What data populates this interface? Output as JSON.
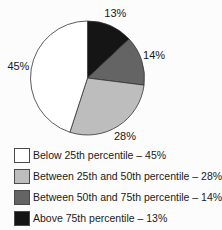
{
  "chart_data": {
    "type": "pie",
    "title": "",
    "start_angle_deg": 0,
    "direction": "clockwise",
    "outline_color": "#333333",
    "slices": [
      {
        "label": "Above 75th percentile",
        "value": 13,
        "display": "13%",
        "color": "#151515"
      },
      {
        "label": "Between 50th and 75th percentile",
        "value": 14,
        "display": "14%",
        "color": "#646464"
      },
      {
        "label": "Between 25th and 50th percentile",
        "value": 28,
        "display": "28%",
        "color": "#bdbdbd"
      },
      {
        "label": "Below 25th percentile",
        "value": 45,
        "display": "45%",
        "color": "#ffffff"
      }
    ]
  },
  "legend": {
    "items": [
      {
        "label": "Below 25th percentile – 45%",
        "color": "#ffffff"
      },
      {
        "label": "Between 25th and 50th percentile – 28%",
        "color": "#bdbdbd"
      },
      {
        "label": "Between 50th and 75th percentile – 14%",
        "color": "#646464"
      },
      {
        "label": "Above 75th percentile – 13%",
        "color": "#151515"
      }
    ]
  }
}
